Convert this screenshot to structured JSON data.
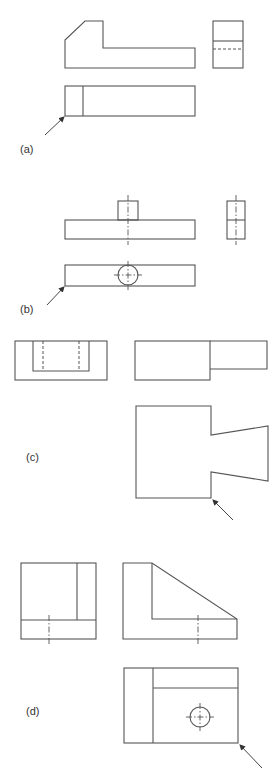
{
  "figure": {
    "panels": [
      {
        "id": "a",
        "label": "(a)"
      },
      {
        "id": "b",
        "label": "(b)"
      },
      {
        "id": "c",
        "label": "(c)"
      },
      {
        "id": "d",
        "label": "(d)"
      }
    ],
    "colors": {
      "line": "#555555",
      "background": "#ffffff"
    }
  }
}
